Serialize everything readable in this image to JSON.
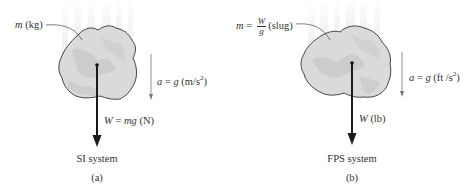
{
  "panels": [
    {
      "id": "a",
      "mass_label": {
        "symbol": "m",
        "unit": "(kg)"
      },
      "weight_label": {
        "symbol": "W",
        "eq": " = ",
        "expr": "mg",
        "unit": " (N)"
      },
      "accel_label": {
        "symbol": "a",
        "eq": " = ",
        "expr": "g",
        "unit_pre": " (m/s",
        "exp": "2",
        "unit_post": ")"
      },
      "system": "SI system",
      "caption": "(a)"
    },
    {
      "id": "b",
      "mass_label": {
        "symbol": "m",
        "eq": " = ",
        "num": "W",
        "den": "g",
        "unit": "(slug)"
      },
      "weight_label": {
        "symbol": "W",
        "unit": " (lb)"
      },
      "accel_label": {
        "symbol": "a",
        "eq": " = ",
        "expr": "g",
        "unit_pre": " (ft /s",
        "exp": "2",
        "unit_post": ")"
      },
      "system": "FPS system",
      "caption": "(b)"
    }
  ],
  "colors": {
    "rock_fill": "#d9d9d9",
    "rock_shade": "#c4c4c4",
    "outline": "#333333",
    "arrow": "#1a1a1a",
    "accel_arrow": "#777777",
    "motion_blur": "#eeeeee"
  }
}
